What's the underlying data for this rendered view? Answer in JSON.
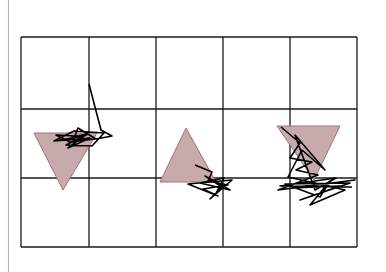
{
  "figure": {
    "colors": {
      "background": "#ffffff",
      "grid": "#1a1a1a",
      "triangle_fill": "#c8aaad",
      "triangle_stroke": "#9e7478",
      "trajectory": "#000000",
      "margin_line": "#c9a9ae"
    },
    "grid": {
      "left": 21,
      "top": 37,
      "right": 357,
      "bottom": 247,
      "cols": [
        21,
        89,
        156,
        223,
        290,
        357
      ],
      "rows": [
        37,
        109,
        178,
        247
      ]
    },
    "triangles": [
      {
        "name": "triangle-down-left",
        "points": "34,133 97,133 63,190"
      },
      {
        "name": "triangle-up-middle",
        "points": "160,182 216,182 186,128"
      },
      {
        "name": "triangle-down-right",
        "points": "277,126 340,126 314,180"
      }
    ],
    "trajectories": [
      {
        "name": "trajectory-left",
        "points": "89,84 101,130 112,136 96,139 78,128 75,136 56,135 70,142 95,139 60,140 84,136 68,148 90,138 54,141 74,131 104,133 92,146 66,145 88,134 71,137"
      },
      {
        "name": "trajectory-middle",
        "points": "195,165 212,172 208,181 228,185 203,189 218,196 188,184 232,180 210,199 222,187 205,176 230,190 200,183 224,178 215,195"
      },
      {
        "name": "trajectory-right",
        "points": "281,127 300,143 290,158 312,162 296,170 318,175 278,190 355,180 292,188 340,186 300,200 350,183 285,184 320,197 330,181 310,205 345,190 288,177 302,150 325,170 295,135 315,190 336,178 280,186 352,187"
      }
    ]
  }
}
